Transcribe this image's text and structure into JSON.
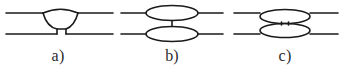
{
  "figure": {
    "background_color": "#ffffff",
    "stroke_color": "#1a1a1a",
    "label_color": "#2b2b2b",
    "width": 342,
    "height": 76,
    "panels": [
      {
        "id": "a",
        "label": "a)",
        "description": "Teardrop / lens body attached to the upper rail, tapering downward to a narrow rectangular neck that meets the lower rail",
        "rail_top_y": 13,
        "rail_bottom_y": 34,
        "shape": "teardrop",
        "connector": "narrow-rectangular-stub"
      },
      {
        "id": "b",
        "label": "b)",
        "description": "Two horizontal ellipses, one centred on each rail, joined by a single vertical line",
        "rail_top_y": 13,
        "rail_bottom_y": 34,
        "shape": "two-ellipses",
        "connector": "single-vertical-line"
      },
      {
        "id": "c",
        "label": "c)",
        "description": "Upper ellipse hanging below the upper rail and lower ellipse rising above the lower rail, joined by a short narrow rectangle",
        "rail_top_y": 13,
        "rail_bottom_y": 34,
        "shape": "two-offset-ellipses",
        "connector": "short-narrow-rectangle"
      }
    ]
  }
}
